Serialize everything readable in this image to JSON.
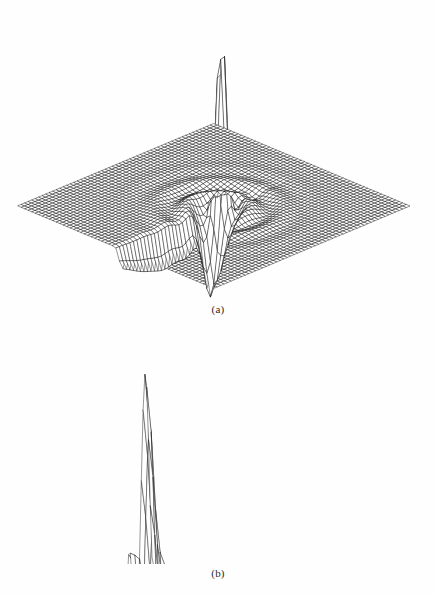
{
  "figure": {
    "background_color": "#ffffff",
    "ink_color": "#141414",
    "panels": [
      {
        "id": "a",
        "caption": "(a)",
        "description": "3D wireframe mesh surface plot: flat baseline plane with a tall narrow spike near the center rising to the top of the frame, a deep dark trough immediately adjacent, and concentric ripple oscillations decaying outward toward the right"
      },
      {
        "id": "b",
        "caption": "(b)",
        "description": "3D wireframe mesh surface plot: corrugated ridged surface, tall narrow spike at the far left edge, with curving ridge crests fanning out and decaying toward the lower right"
      }
    ]
  },
  "chart_data": [
    {
      "type": "surface",
      "panel": "a",
      "title": "",
      "subtitle": "",
      "xlabel": "",
      "ylabel": "",
      "zlabel": "",
      "legend": [],
      "annotations": [
        "(a)"
      ],
      "grid": true,
      "legend_position": "none",
      "projection": {
        "kind": "parallel-oblique",
        "azimuth_deg": 35,
        "elevation_deg": 28,
        "x_axis_screen": [
          1.0,
          0.42
        ],
        "y_axis_screen": [
          1.0,
          -0.42
        ],
        "z_axis_screen": [
          0.0,
          -1.0
        ]
      },
      "mesh": {
        "nu": 56,
        "nv": 56,
        "wire_only": true,
        "hidden_line_removal": true
      },
      "domain": {
        "u": [
          -1.0,
          1.0
        ],
        "v": [
          -1.0,
          1.0
        ]
      },
      "zlim": [
        -0.35,
        1.0
      ],
      "surface_model": {
        "formula": "z(u,v) = A*exp(-((u-u0)^2/su^2 + (v-v0)^2/sv^2)) - B*exp(-((u-u1)^2/tu^2 + (v-v1)^2/tv^2)) + C*cos(k*r)*exp(-d*r)",
        "spike": {
          "u0": 0.02,
          "v0": 0.06,
          "amplitude": 1.0,
          "su": 0.055,
          "sv": 0.055
        },
        "trough": {
          "u1": 0.1,
          "v1": -0.1,
          "amplitude": 0.33,
          "tu": 0.1,
          "tv": 0.1
        },
        "ripple": {
          "amplitude": 0.1,
          "wavenumber": 26.0,
          "decay": 5.5,
          "center": [
            0.05,
            0.0
          ]
        },
        "baseline": 0.0
      },
      "features": [
        {
          "name": "spike-peak",
          "screen_xy": [
            196,
            13
          ],
          "z_value": 1.0
        },
        {
          "name": "trough-minimum",
          "screen_xy": [
            205,
            200
          ],
          "z_value": -0.33
        },
        {
          "name": "plane-corner-left",
          "screen_xy": [
            22,
            185
          ]
        },
        {
          "name": "plane-corner-top",
          "screen_xy": [
            165,
            152
          ]
        },
        {
          "name": "plane-corner-right",
          "screen_xy": [
            412,
            230
          ]
        },
        {
          "name": "plane-corner-bottom",
          "screen_xy": [
            268,
            295
          ]
        }
      ]
    },
    {
      "type": "surface",
      "panel": "b",
      "title": "",
      "subtitle": "",
      "xlabel": "",
      "ylabel": "",
      "zlabel": "",
      "legend": [],
      "annotations": [
        "(b)"
      ],
      "grid": true,
      "legend_position": "none",
      "projection": {
        "kind": "parallel-oblique",
        "azimuth_deg": 20,
        "elevation_deg": 22,
        "x_axis_screen": [
          1.0,
          0.3
        ],
        "y_axis_screen": [
          0.55,
          -0.62
        ],
        "z_axis_screen": [
          0.0,
          -1.0
        ]
      },
      "mesh": {
        "nu": 60,
        "nv": 46,
        "wire_only": true,
        "hidden_line_removal": true
      },
      "domain": {
        "u": [
          0.0,
          1.0
        ],
        "v": [
          0.0,
          1.0
        ]
      },
      "zlim": [
        -0.2,
        1.0
      ],
      "surface_model": {
        "formula": "z(u,v) = exp(-a*u) * cos(2*pi*f(u)*v) * g(v) + spike(u,v)",
        "edge_spike": {
          "u0": 0.0,
          "v0": 0.93,
          "amplitude": 1.0,
          "width": 0.03
        },
        "ridge_count": 11,
        "ridge_decay": 2.4,
        "ridge_curvature": 0.45,
        "baseline": 0.0
      },
      "features": [
        {
          "name": "edge-spike-peak",
          "screen_xy": [
            58,
            338
          ],
          "z_value": 1.0
        },
        {
          "name": "second-crest",
          "screen_xy": [
            98,
            372
          ],
          "z_value": 0.72
        },
        {
          "name": "surface-corner-right",
          "screen_xy": [
            412,
            428
          ]
        },
        {
          "name": "surface-corner-bottom-right",
          "screen_xy": [
            330,
            556
          ]
        },
        {
          "name": "surface-corner-bottom-left",
          "screen_xy": [
            70,
            512
          ]
        }
      ]
    }
  ]
}
